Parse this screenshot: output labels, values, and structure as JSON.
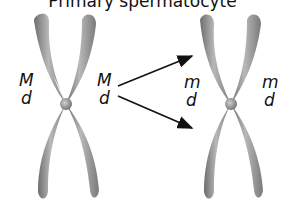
{
  "title": "Primary spermatocyte",
  "left_chromosome": {
    "left_labels": [
      "M",
      "d"
    ],
    "right_labels": [
      "M",
      "d"
    ]
  },
  "right_chromosome": {
    "left_labels": [
      "m",
      "d"
    ],
    "right_labels": [
      "m",
      "d"
    ]
  },
  "arrows": [
    {
      "from": "left_chromosome",
      "to": "right_chromosome_upper"
    },
    {
      "from": "left_chromosome",
      "to": "right_chromosome_lower"
    }
  ],
  "colors": {
    "chromosome": "#8c8c8c",
    "arrow": "#111111",
    "text": "#111111"
  }
}
